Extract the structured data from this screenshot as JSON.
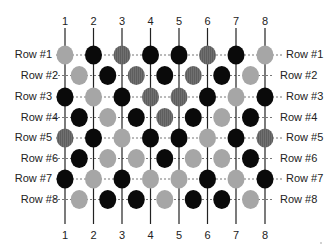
{
  "diagram": {
    "columns": [
      "1",
      "2",
      "3",
      "4",
      "5",
      "6",
      "7",
      "8"
    ],
    "rows": [
      {
        "label": "Row #1",
        "placement": "on-column",
        "beads": [
          "light",
          "black",
          "mid",
          "black",
          "black",
          "mid",
          "black",
          "light"
        ]
      },
      {
        "label": "Row #2",
        "placement": "between-columns",
        "beads": [
          "light",
          "black",
          "mid",
          "black",
          "mid",
          "black",
          "light"
        ]
      },
      {
        "label": "Row #3",
        "placement": "on-column",
        "beads": [
          "black",
          "light",
          "black",
          "mid",
          "mid",
          "black",
          "light",
          "black"
        ]
      },
      {
        "label": "Row #4",
        "placement": "between-columns",
        "beads": [
          "black",
          "light",
          "black",
          "mid",
          "black",
          "light",
          "black"
        ]
      },
      {
        "label": "Row #5",
        "placement": "on-column",
        "beads": [
          "mid",
          "black",
          "light",
          "black",
          "black",
          "light",
          "black",
          "mid"
        ]
      },
      {
        "label": "Row #6",
        "placement": "between-columns",
        "beads": [
          "black",
          "light",
          "light",
          "black",
          "light",
          "light",
          "black"
        ]
      },
      {
        "label": "Row #7",
        "placement": "on-column",
        "beads": [
          "black",
          "light",
          "black",
          "light",
          "light",
          "black",
          "light",
          "black"
        ]
      },
      {
        "label": "Row #8",
        "placement": "between-columns",
        "beads": [
          "light",
          "black",
          "black",
          "light",
          "black",
          "black",
          "light"
        ]
      }
    ],
    "colors": {
      "black": "#0a0a0a",
      "mid": "#6e6e6e",
      "light": "#a6a6a6",
      "line": "#222222",
      "dash": "#777777"
    }
  }
}
